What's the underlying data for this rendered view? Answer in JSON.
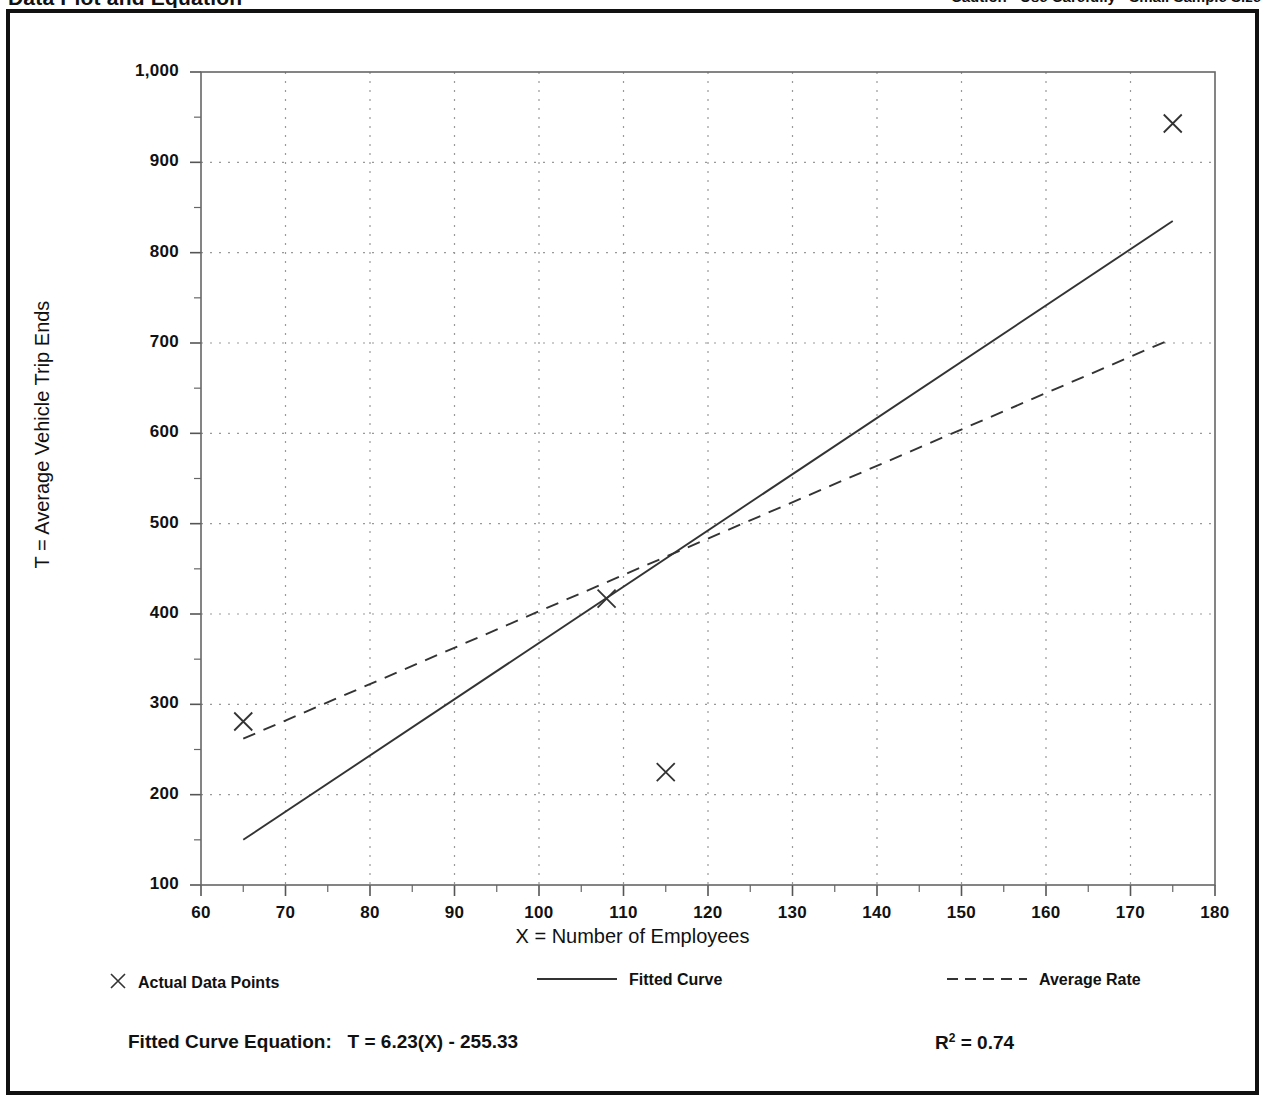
{
  "header": {
    "title": "Data Plot and Equation",
    "caution": "Caution - Use Carefully - Small Sample Size"
  },
  "legend": {
    "actual_points_label": "Actual Data Points",
    "fitted_curve_label": "Fitted Curve",
    "average_rate_label": "Average Rate",
    "marker_glyph": "✕"
  },
  "footer": {
    "equation_label": "Fitted Curve Equation:",
    "equation": "T = 6.23(X) - 255.33",
    "r2_symbol": "R",
    "r2_exponent": "2",
    "r2_value": "= 0.74"
  },
  "chart_data": {
    "type": "scatter",
    "title": "Data Plot and Equation",
    "xlabel": "X = Number of Employees",
    "ylabel": "T = Average Vehicle Trip Ends",
    "xlim": [
      60,
      180
    ],
    "ylim": [
      100,
      1000
    ],
    "xticks": [
      60,
      70,
      80,
      90,
      100,
      110,
      120,
      130,
      140,
      150,
      160,
      170,
      180
    ],
    "yticks": [
      100,
      200,
      300,
      400,
      500,
      600,
      700,
      800,
      900,
      1000
    ],
    "xticklabels": [
      "60",
      "70",
      "80",
      "90",
      "100",
      "110",
      "120",
      "130",
      "140",
      "150",
      "160",
      "170",
      "180"
    ],
    "yticklabels": [
      "100",
      "200",
      "300",
      "400",
      "500",
      "600",
      "700",
      "800",
      "900",
      "1,000"
    ],
    "minor_tick_step_x": 5,
    "minor_tick_step_y": 50,
    "grid": true,
    "grid_style": "dotted",
    "legend_position": "below-axes",
    "series": [
      {
        "name": "Actual Data Points",
        "type": "scatter",
        "marker": "x",
        "points": [
          {
            "x": 65,
            "y": 281
          },
          {
            "x": 108,
            "y": 417
          },
          {
            "x": 115,
            "y": 225
          },
          {
            "x": 175,
            "y": 943
          }
        ]
      },
      {
        "name": "Fitted Curve",
        "type": "line",
        "style": "solid",
        "equation": "T = 6.23(X) - 255.33",
        "r_squared": 0.74,
        "endpoints": [
          {
            "x": 65,
            "y": 150
          },
          {
            "x": 175,
            "y": 835
          }
        ]
      },
      {
        "name": "Average Rate",
        "type": "line",
        "style": "dashed",
        "endpoints": [
          {
            "x": 65,
            "y": 262
          },
          {
            "x": 175,
            "y": 705
          }
        ]
      }
    ]
  }
}
